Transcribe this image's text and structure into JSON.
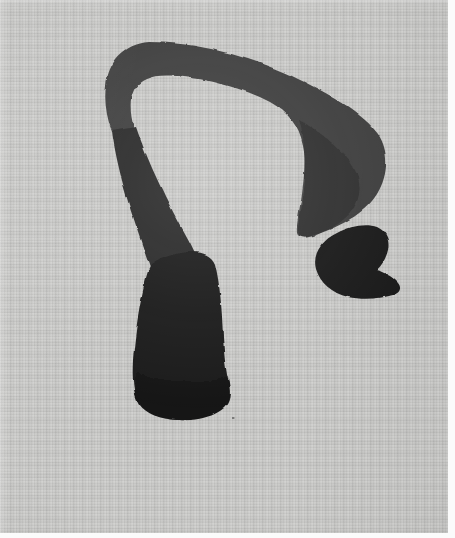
{
  "artwork": {
    "title": "Untitled ink brush mark",
    "medium": "brush and ink on textured paper",
    "caption": "",
    "support_color": "#c9c9c7",
    "ink_color": "#1f1f1f",
    "ink_color_light": "#4c4c4c",
    "margin_color": "#fbfbfb",
    "canvas": {
      "width": 455,
      "height": 538
    },
    "sheet": {
      "x": 0,
      "y": 0,
      "width": 448,
      "height": 533
    },
    "strokes": [
      {
        "name": "arch-hook-stroke",
        "description": "Broad arching stroke sweeping from upper left over the top and down the right, ending in a heavy wedge tip",
        "tone": "#3f3f3f",
        "path": "M 106 86 C 108 62 124 44 149 42 C 196 42 248 56 292 76 C 330 94 362 112 378 134 C 390 152 388 176 377 194 C 366 212 344 224 326 231 C 314 236 304 240 300 236 C 296 231 299 222 301 212 C 305 190 307 166 303 146 C 299 126 288 112 270 102 C 244 88 208 79 176 76 C 155 74 140 78 134 90 C 129 100 130 114 134 128 L 112 132 C 106 116 104 100 106 86 Z"
      },
      {
        "name": "descending-stem-stroke",
        "description": "Stroke descending from the arch's left shoulder, thickening downward",
        "tone": "#2b2b2b",
        "path": "M 112 131 L 136 127 C 146 156 158 182 170 206 C 180 226 190 242 196 256 L 150 268 C 142 244 132 216 124 188 C 118 166 114 147 112 131 Z"
      },
      {
        "name": "vertical-mass-stroke",
        "description": "Heavy rounded vertical mass occupying the lower left, wider at bottom with a rounded foot",
        "tone": "#1c1c1c",
        "path": "M 151 265 C 162 257 178 252 192 252 C 204 252 212 256 215 264 C 220 284 222 310 223 336 C 224 356 226 372 229 384 C 231 394 230 402 224 408 C 214 417 196 421 178 420 C 160 419 146 414 139 404 C 133 394 132 378 133 360 C 135 332 140 302 145 282 C 147 273 149 268 151 265 Z"
      },
      {
        "name": "detached-comma-blob",
        "description": "Separate comma / crescent shaped blob to the right, with a pointed tail at its lower right",
        "tone": "#1c1c1c",
        "path": "M 337 233 C 350 226 366 223 377 227 C 386 231 390 240 388 250 C 386 259 381 266 377 270 C 383 272 392 276 398 283 C 402 288 400 293 393 295 C 380 299 362 300 348 297 C 332 293 320 283 316 269 C 312 254 322 240 337 233 Z"
      },
      {
        "name": "ink-speck",
        "description": "Tiny isolated ink speck below right of the vertical mass",
        "tone": "#555555",
        "path": "M 232 417 l 2.4 0 l 0 2.0 l -2.4 0 Z"
      }
    ]
  }
}
